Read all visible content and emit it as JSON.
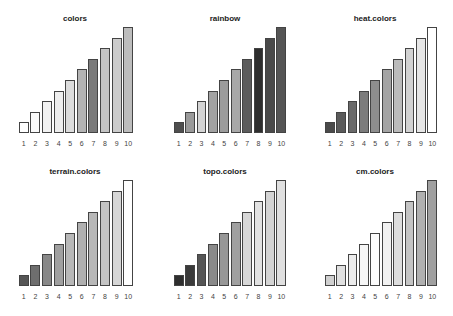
{
  "chart_data": [
    {
      "type": "bar",
      "title": "colors",
      "categories": [
        "1",
        "2",
        "3",
        "4",
        "5",
        "6",
        "7",
        "8",
        "9",
        "10"
      ],
      "values": [
        1,
        2,
        3,
        4,
        5,
        6,
        7,
        8,
        9,
        10
      ],
      "bar_colors": [
        "#ffffff",
        "#fafafa",
        "#f2f2f2",
        "#eeeeee",
        "#dcdcdc",
        "#b4b4b4",
        "#7a7a7a",
        "#c4c4c4",
        "#cccccc",
        "#bdbdbd"
      ],
      "xlabel": "",
      "ylabel": "",
      "ylim": [
        0,
        10
      ],
      "grid": false,
      "legend": false
    },
    {
      "type": "bar",
      "title": "rainbow",
      "categories": [
        "1",
        "2",
        "3",
        "4",
        "5",
        "6",
        "7",
        "8",
        "9",
        "10"
      ],
      "values": [
        1,
        2,
        3,
        4,
        5,
        6,
        7,
        8,
        9,
        10
      ],
      "bar_colors": [
        "#4e4e4e",
        "#9a9a9a",
        "#d4d4d4",
        "#a2a2a2",
        "#9c9c9c",
        "#a8a8a8",
        "#5c5c5c",
        "#2e2e2e",
        "#4a4a4a",
        "#555555"
      ],
      "xlabel": "",
      "ylabel": "",
      "ylim": [
        0,
        10
      ],
      "grid": false,
      "legend": false
    },
    {
      "type": "bar",
      "title": "heat.colors",
      "categories": [
        "1",
        "2",
        "3",
        "4",
        "5",
        "6",
        "7",
        "8",
        "9",
        "10"
      ],
      "values": [
        1,
        2,
        3,
        4,
        5,
        6,
        7,
        8,
        9,
        10
      ],
      "bar_colors": [
        "#4a4a4a",
        "#5a5a5a",
        "#6a6a6a",
        "#7c7c7c",
        "#8e8e8e",
        "#a4a4a4",
        "#bbbbbb",
        "#d2d2d2",
        "#e6e6e6",
        "#ffffff"
      ],
      "xlabel": "",
      "ylabel": "",
      "ylim": [
        0,
        10
      ],
      "grid": false,
      "legend": false
    },
    {
      "type": "bar",
      "title": "terrain.colors",
      "categories": [
        "1",
        "2",
        "3",
        "4",
        "5",
        "6",
        "7",
        "8",
        "9",
        "10"
      ],
      "values": [
        1,
        2,
        3,
        4,
        5,
        6,
        7,
        8,
        9,
        10
      ],
      "bar_colors": [
        "#555555",
        "#6e6e6e",
        "#888888",
        "#a0a0a0",
        "#b8b8b8",
        "#b0b0b0",
        "#b8b8b8",
        "#c4c4c4",
        "#d6d6d6",
        "#ffffff"
      ],
      "xlabel": "",
      "ylabel": "",
      "ylim": [
        0,
        10
      ],
      "grid": false,
      "legend": false
    },
    {
      "type": "bar",
      "title": "topo.colors",
      "categories": [
        "1",
        "2",
        "3",
        "4",
        "5",
        "6",
        "7",
        "8",
        "9",
        "10"
      ],
      "values": [
        1,
        2,
        3,
        4,
        5,
        6,
        7,
        8,
        9,
        10
      ],
      "bar_colors": [
        "#2e2e2e",
        "#3a3a3a",
        "#555555",
        "#8a8a8a",
        "#979797",
        "#a0a0a0",
        "#d8d8d8",
        "#e2e2e2",
        "#d4d4d4",
        "#e0e0e0"
      ],
      "xlabel": "",
      "ylabel": "",
      "ylim": [
        0,
        10
      ],
      "grid": false,
      "legend": false
    },
    {
      "type": "bar",
      "title": "cm.colors",
      "categories": [
        "1",
        "2",
        "3",
        "4",
        "5",
        "6",
        "7",
        "8",
        "9",
        "10"
      ],
      "values": [
        1,
        2,
        3,
        4,
        5,
        6,
        7,
        8,
        9,
        10
      ],
      "bar_colors": [
        "#d0d0d0",
        "#e0e0e0",
        "#ececec",
        "#f6f6f6",
        "#fcfcfc",
        "#f2f2f2",
        "#dddddd",
        "#c4c4c4",
        "#b0b0b0",
        "#a0a0a0"
      ],
      "xlabel": "",
      "ylabel": "",
      "ylim": [
        0,
        10
      ],
      "grid": false,
      "legend": false
    }
  ],
  "layout": {
    "panels": [
      {
        "left": 0,
        "top": 0,
        "bars_left": 18,
        "bars_width": 116,
        "baseline": 133,
        "max_height": 106,
        "tick_y": 140
      },
      {
        "left": 150,
        "top": 0,
        "bars_left": 23,
        "bars_width": 114,
        "baseline": 133,
        "max_height": 106,
        "tick_y": 140
      },
      {
        "left": 300,
        "top": 0,
        "bars_left": 24,
        "bars_width": 114,
        "baseline": 133,
        "max_height": 106,
        "tick_y": 140
      },
      {
        "left": 0,
        "top": 153,
        "bars_left": 18,
        "bars_width": 116,
        "baseline": 133,
        "max_height": 106,
        "tick_y": 140
      },
      {
        "left": 150,
        "top": 153,
        "bars_left": 23,
        "bars_width": 114,
        "baseline": 133,
        "max_height": 106,
        "tick_y": 140
      },
      {
        "left": 300,
        "top": 153,
        "bars_left": 24,
        "bars_width": 114,
        "baseline": 133,
        "max_height": 106,
        "tick_y": 140
      }
    ]
  }
}
